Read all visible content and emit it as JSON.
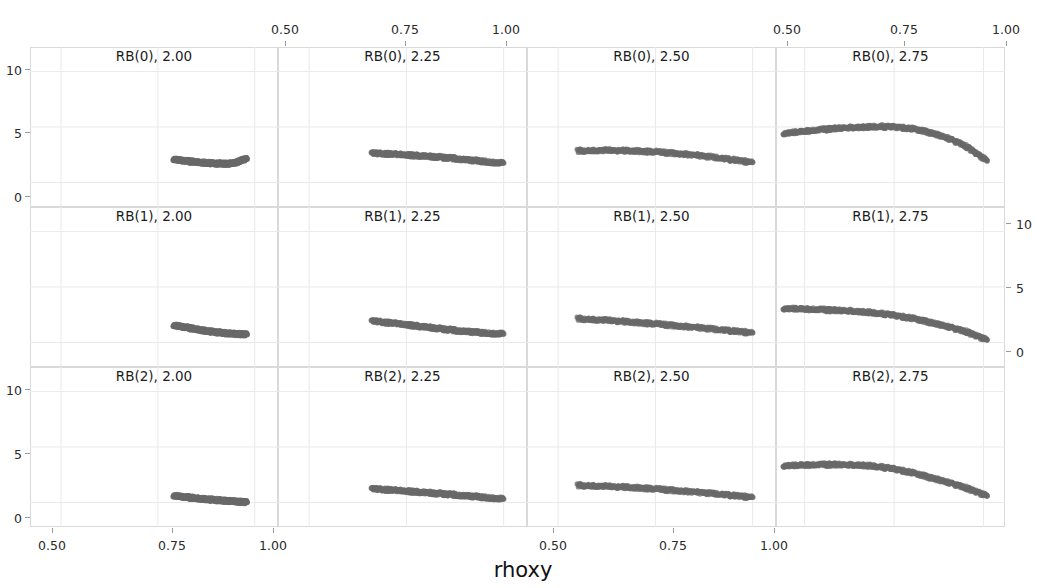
{
  "figure": {
    "title": "",
    "xlabel": "rhoxy",
    "ylabel": "",
    "marker_color": "#696969",
    "frame_color": "#d9d9d9",
    "grid_color": "#e9e9ee"
  },
  "axes": {
    "x_ticks": [
      "0.50",
      "0.75",
      "1.00"
    ],
    "x_tick_values": [
      0.5,
      0.75,
      1.0
    ],
    "y_ticks": [
      "10",
      "5",
      "0"
    ],
    "y_tick_values": [
      10,
      5,
      0
    ],
    "xlim": [
      0.42,
      1.06
    ],
    "ylim": [
      -2.2,
      12.2
    ]
  },
  "facets": {
    "rows": [
      "RB(0)",
      "RB(1)",
      "RB(2)"
    ],
    "cols": [
      "2.00",
      "2.25",
      "2.50",
      "2.75"
    ],
    "titles": [
      [
        "RB(0), 2.00",
        "RB(0), 2.25",
        "RB(0), 2.50",
        "RB(0), 2.75"
      ],
      [
        "RB(1), 2.00",
        "RB(1), 2.25",
        "RB(1), 2.50",
        "RB(1), 2.75"
      ],
      [
        "RB(2), 2.00",
        "RB(2), 2.25",
        "RB(2), 2.50",
        "RB(2), 2.75"
      ]
    ]
  },
  "chart_data": {
    "type": "scatter",
    "title": "",
    "xlabel": "rhoxy",
    "ylabel": "",
    "xlim": [
      0.42,
      1.06
    ],
    "ylim": [
      -2.2,
      12.2
    ],
    "grid": true,
    "legend": "none",
    "layout": "3 rows (RB(0), RB(1), RB(2)) x 4 columns (2.00, 2.25, 2.50, 2.75)",
    "marker_color": "#696969",
    "panels": [
      {
        "row": "RB(0)",
        "col": "2.00",
        "title": "RB(0), 2.00",
        "x": [
          0.79,
          0.8,
          0.81,
          0.82,
          0.83,
          0.84,
          0.85,
          0.86,
          0.87,
          0.88,
          0.89,
          0.9,
          0.91,
          0.92,
          0.93,
          0.94,
          0.95,
          0.96,
          0.97,
          0.98
        ],
        "y": [
          2.1,
          2.05,
          2.0,
          1.96,
          1.92,
          1.88,
          1.85,
          1.82,
          1.79,
          1.76,
          1.74,
          1.72,
          1.71,
          1.7,
          1.7,
          1.72,
          1.78,
          1.92,
          2.05,
          2.12
        ]
      },
      {
        "row": "RB(0)",
        "col": "2.25",
        "title": "RB(0), 2.25",
        "x": [
          0.66,
          0.68,
          0.7,
          0.72,
          0.74,
          0.76,
          0.78,
          0.8,
          0.82,
          0.84,
          0.86,
          0.88,
          0.9,
          0.92,
          0.94,
          0.96,
          0.98,
          1.0
        ],
        "y": [
          2.65,
          2.62,
          2.58,
          2.54,
          2.5,
          2.46,
          2.42,
          2.38,
          2.33,
          2.28,
          2.22,
          2.15,
          2.08,
          2.0,
          1.93,
          1.86,
          1.8,
          1.76
        ]
      },
      {
        "row": "RB(0)",
        "col": "2.50",
        "title": "RB(0), 2.50",
        "x": [
          0.55,
          0.58,
          0.61,
          0.64,
          0.67,
          0.7,
          0.73,
          0.76,
          0.79,
          0.82,
          0.85,
          0.88,
          0.91,
          0.94,
          0.97,
          1.0
        ],
        "y": [
          2.85,
          2.88,
          2.9,
          2.9,
          2.88,
          2.85,
          2.8,
          2.74,
          2.66,
          2.58,
          2.48,
          2.36,
          2.24,
          2.1,
          1.96,
          1.82
        ]
      },
      {
        "row": "RB(0)",
        "col": "2.75",
        "title": "RB(0), 2.75",
        "x": [
          0.44,
          0.47,
          0.5,
          0.53,
          0.56,
          0.59,
          0.62,
          0.65,
          0.68,
          0.71,
          0.74,
          0.77,
          0.8,
          0.83,
          0.86,
          0.89,
          0.92,
          0.95,
          0.98,
          1.01
        ],
        "y": [
          4.4,
          4.52,
          4.62,
          4.72,
          4.8,
          4.88,
          4.94,
          4.98,
          5.02,
          5.04,
          5.02,
          4.96,
          4.84,
          4.66,
          4.42,
          4.1,
          3.72,
          3.3,
          2.6,
          1.95
        ]
      },
      {
        "row": "RB(1)",
        "col": "2.00",
        "title": "RB(1), 2.00",
        "x": [
          0.79,
          0.8,
          0.81,
          0.82,
          0.83,
          0.84,
          0.85,
          0.86,
          0.87,
          0.88,
          0.89,
          0.9,
          0.91,
          0.92,
          0.93,
          0.94,
          0.95,
          0.96,
          0.97,
          0.98
        ],
        "y": [
          1.55,
          1.5,
          1.44,
          1.38,
          1.32,
          1.26,
          1.2,
          1.14,
          1.08,
          1.03,
          0.98,
          0.94,
          0.9,
          0.86,
          0.83,
          0.8,
          0.78,
          0.76,
          0.74,
          0.72
        ]
      },
      {
        "row": "RB(1)",
        "col": "2.25",
        "title": "RB(1), 2.25",
        "x": [
          0.66,
          0.68,
          0.7,
          0.72,
          0.74,
          0.76,
          0.78,
          0.8,
          0.82,
          0.84,
          0.86,
          0.88,
          0.9,
          0.92,
          0.94,
          0.96,
          0.98,
          1.0
        ],
        "y": [
          1.95,
          1.88,
          1.8,
          1.72,
          1.64,
          1.56,
          1.48,
          1.4,
          1.32,
          1.24,
          1.16,
          1.08,
          1.02,
          0.96,
          0.9,
          0.85,
          0.81,
          0.78
        ]
      },
      {
        "row": "RB(1)",
        "col": "2.50",
        "title": "RB(1), 2.50",
        "x": [
          0.55,
          0.58,
          0.61,
          0.64,
          0.67,
          0.7,
          0.73,
          0.76,
          0.79,
          0.82,
          0.85,
          0.88,
          0.91,
          0.94,
          0.97,
          1.0
        ],
        "y": [
          2.15,
          2.1,
          2.04,
          1.98,
          1.9,
          1.82,
          1.74,
          1.65,
          1.56,
          1.47,
          1.38,
          1.28,
          1.18,
          1.08,
          0.98,
          0.88
        ]
      },
      {
        "row": "RB(1)",
        "col": "2.75",
        "title": "RB(1), 2.75",
        "x": [
          0.44,
          0.47,
          0.5,
          0.53,
          0.56,
          0.59,
          0.62,
          0.65,
          0.68,
          0.71,
          0.74,
          0.77,
          0.8,
          0.83,
          0.86,
          0.89,
          0.92,
          0.95,
          0.98,
          1.01
        ],
        "y": [
          3.05,
          3.05,
          3.02,
          2.98,
          2.94,
          2.9,
          2.86,
          2.8,
          2.72,
          2.62,
          2.5,
          2.35,
          2.18,
          1.98,
          1.75,
          1.5,
          1.25,
          1.0,
          0.6,
          0.22
        ]
      },
      {
        "row": "RB(2)",
        "col": "2.00",
        "title": "RB(2), 2.00",
        "x": [
          0.79,
          0.8,
          0.81,
          0.82,
          0.83,
          0.84,
          0.85,
          0.86,
          0.87,
          0.88,
          0.89,
          0.9,
          0.91,
          0.92,
          0.93,
          0.94,
          0.95,
          0.96,
          0.97,
          0.98
        ],
        "y": [
          0.62,
          0.58,
          0.54,
          0.5,
          0.46,
          0.42,
          0.38,
          0.35,
          0.32,
          0.29,
          0.26,
          0.23,
          0.2,
          0.17,
          0.15,
          0.12,
          0.1,
          0.07,
          0.05,
          0.02
        ]
      },
      {
        "row": "RB(2)",
        "col": "2.25",
        "title": "RB(2), 2.25",
        "x": [
          0.66,
          0.68,
          0.7,
          0.72,
          0.74,
          0.76,
          0.78,
          0.8,
          0.82,
          0.84,
          0.86,
          0.88,
          0.9,
          0.92,
          0.94,
          0.96,
          0.98,
          1.0
        ],
        "y": [
          1.25,
          1.2,
          1.15,
          1.1,
          1.05,
          1.0,
          0.95,
          0.9,
          0.85,
          0.8,
          0.74,
          0.68,
          0.62,
          0.56,
          0.5,
          0.44,
          0.38,
          0.32
        ]
      },
      {
        "row": "RB(2)",
        "col": "2.50",
        "title": "RB(2), 2.50",
        "x": [
          0.55,
          0.58,
          0.61,
          0.64,
          0.67,
          0.7,
          0.73,
          0.76,
          0.79,
          0.82,
          0.85,
          0.88,
          0.91,
          0.94,
          0.97,
          1.0
        ],
        "y": [
          1.55,
          1.52,
          1.48,
          1.44,
          1.4,
          1.34,
          1.28,
          1.2,
          1.12,
          1.04,
          0.96,
          0.87,
          0.78,
          0.68,
          0.58,
          0.48
        ]
      },
      {
        "row": "RB(2)",
        "col": "2.75",
        "title": "RB(2), 2.75",
        "x": [
          0.44,
          0.47,
          0.5,
          0.53,
          0.56,
          0.59,
          0.62,
          0.65,
          0.68,
          0.71,
          0.74,
          0.77,
          0.8,
          0.83,
          0.86,
          0.89,
          0.92,
          0.95,
          0.98,
          1.01
        ],
        "y": [
          3.3,
          3.34,
          3.38,
          3.4,
          3.42,
          3.42,
          3.4,
          3.38,
          3.32,
          3.22,
          3.08,
          2.9,
          2.68,
          2.44,
          2.18,
          1.9,
          1.62,
          1.34,
          0.95,
          0.58
        ]
      }
    ]
  }
}
